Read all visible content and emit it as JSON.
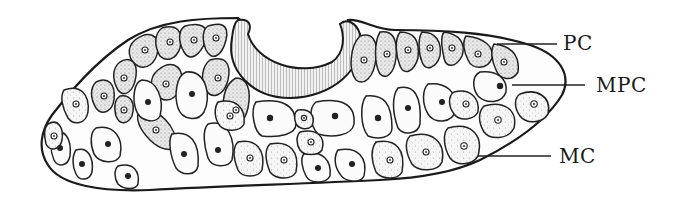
{
  "figure": {
    "type": "biological cross-section illustration",
    "background_color": "#ffffff",
    "line_color": "#1a1a1a",
    "labels": [
      {
        "id": "pc",
        "text": "PC",
        "x": 563,
        "y": 32
      },
      {
        "id": "mpc",
        "text": "MPC",
        "x": 596,
        "y": 74
      },
      {
        "id": "mc",
        "text": "MC",
        "x": 560,
        "y": 145
      }
    ],
    "leader_lines": [
      {
        "label": "PC",
        "from": [
          497,
          44
        ],
        "to": [
          557,
          44
        ]
      },
      {
        "label": "MPC",
        "from": [
          512,
          85
        ],
        "to": [
          585,
          85
        ]
      },
      {
        "label": "MC",
        "from": [
          478,
          156
        ],
        "to": [
          551,
          156
        ]
      }
    ]
  }
}
